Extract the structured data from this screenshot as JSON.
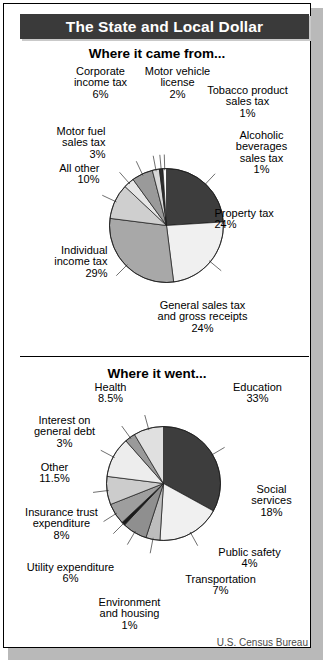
{
  "header": {
    "title": "The State and Local Dollar"
  },
  "credit": "U.S. Census Bureau",
  "sections": [
    {
      "title": "Where it came from..."
    },
    {
      "title": "Where it went..."
    }
  ],
  "chart_data": [
    {
      "type": "pie",
      "title": "Where it came from...",
      "unit": "%",
      "categories": [
        "Property tax",
        "General sales tax and gross receipts",
        "Individual income tax",
        "All other",
        "Motor fuel sales tax",
        "Corporate income tax",
        "Motor vehicle license",
        "Tobacco product sales tax",
        "Alcoholic beverages sales tax"
      ],
      "values": [
        24,
        24,
        29,
        10,
        3,
        6,
        2,
        1,
        1
      ],
      "labels": [
        "Property tax\n24%",
        "General sales tax\nand gross receipts\n24%",
        "Individual\nincome tax\n29%",
        "All other\n10%",
        "Motor fuel\nsales tax\n3%",
        "Corporate\nincome tax\n6%",
        "Motor vehicle\nlicense\n2%",
        "Tobacco product\nsales tax\n1%",
        "Alcoholic\nbeverages\nsales tax\n1%"
      ],
      "colors": [
        "#3d3d3d",
        "#f0f0f0",
        "#a8a8a8",
        "#cfcfcf",
        "#e6e6e6",
        "#9a9a9a",
        "#d8d8d8",
        "#2e2e2e",
        "#fafafa"
      ],
      "legend": "callout-labels",
      "grid": false
    },
    {
      "type": "pie",
      "title": "Where it went...",
      "unit": "%",
      "categories": [
        "Education",
        "Social services",
        "Public safety",
        "Transportation",
        "Environment and housing",
        "Utility expenditure",
        "Insurance trust expenditure",
        "Other",
        "Interest on general debt",
        "Health"
      ],
      "values": [
        33,
        18,
        4,
        7,
        1,
        6,
        8,
        11.5,
        3,
        8.5
      ],
      "labels": [
        "Education\n33%",
        "Social\nservices\n18%",
        "Public safety\n4%",
        "Transportation\n7%",
        "Environment\nand housing\n1%",
        "Utility expenditure\n6%",
        "Insurance trust\nexpenditure\n8%",
        "Other\n11.5%",
        "Interest on\ngeneral debt\n3%",
        "Health\n8.5%"
      ],
      "colors": [
        "#3d3d3d",
        "#f0f0f0",
        "#bdbdbd",
        "#8f8f8f",
        "#1a1a1a",
        "#9e9e9e",
        "#cccccc",
        "#ededed",
        "#9a9a9a",
        "#e0e0e0"
      ],
      "legend": "callout-labels",
      "grid": false
    }
  ],
  "label_positions": [
    [
      {
        "x": 215,
        "y": 208,
        "w": 105,
        "align": "l",
        "lx": 206,
        "ly": 214,
        "px": null
      },
      {
        "x": 138,
        "y": 300,
        "w": 130,
        "align": "c",
        "lx": null,
        "ly": null,
        "px": null
      },
      {
        "x": 16,
        "y": 245,
        "w": 92,
        "align": "r",
        "lx": null,
        "ly": null,
        "px": null
      },
      {
        "x": 10,
        "y": 163,
        "w": 90,
        "align": "r",
        "lx": null,
        "ly": null,
        "px": null
      },
      {
        "x": 20,
        "y": 126,
        "w": 86,
        "align": "r",
        "lx": null,
        "ly": null,
        "px": null
      },
      {
        "x": 62,
        "y": 66,
        "w": 78,
        "align": "c",
        "lx": null,
        "ly": null,
        "px": null
      },
      {
        "x": 140,
        "y": 66,
        "w": 76,
        "align": "c",
        "lx": null,
        "ly": null,
        "px": null
      },
      {
        "x": 202,
        "y": 85,
        "w": 92,
        "align": "c",
        "lx": null,
        "ly": null,
        "px": null
      },
      {
        "x": 222,
        "y": 130,
        "w": 80,
        "align": "c",
        "lx": null,
        "ly": null,
        "px": null
      }
    ],
    [
      {
        "x": 212,
        "y": 382,
        "w": 92,
        "align": "c"
      },
      {
        "x": 236,
        "y": 484,
        "w": 72,
        "align": "c"
      },
      {
        "x": 202,
        "y": 547,
        "w": 96,
        "align": "c"
      },
      {
        "x": 172,
        "y": 574,
        "w": 98,
        "align": "c"
      },
      {
        "x": 82,
        "y": 597,
        "w": 96,
        "align": "c"
      },
      {
        "x": 16,
        "y": 562,
        "w": 110,
        "align": "c"
      },
      {
        "x": 10,
        "y": 507,
        "w": 104,
        "align": "c"
      },
      {
        "x": 24,
        "y": 462,
        "w": 62,
        "align": "c"
      },
      {
        "x": 16,
        "y": 415,
        "w": 98,
        "align": "c"
      },
      {
        "x": 78,
        "y": 382,
        "w": 66,
        "align": "c"
      }
    ]
  ]
}
